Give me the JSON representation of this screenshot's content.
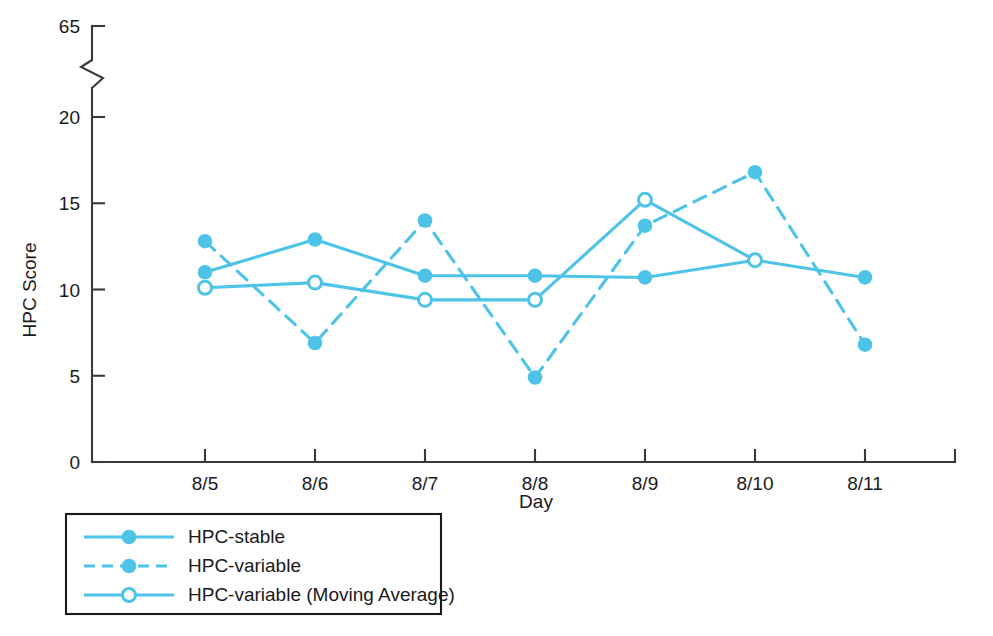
{
  "chart_data": {
    "type": "line",
    "title": "",
    "xlabel": "Day",
    "ylabel": "HPC Score",
    "categories": [
      "8/5",
      "8/6",
      "8/7",
      "8/8",
      "8/9",
      "8/10",
      "8/11"
    ],
    "ytick_labels": [
      "0",
      "5",
      "10",
      "15",
      "20",
      "65"
    ],
    "ytick_values": [
      0,
      5,
      10,
      15,
      20,
      65
    ],
    "ylim": [
      0,
      20
    ],
    "axis_break": {
      "present": true,
      "between": [
        20,
        65
      ],
      "note": "y-axis broken between 20 and 65"
    },
    "grid": false,
    "legend_position": "below-left",
    "accent_color": "#4EC3E8",
    "axis_color": "#3a3a3a",
    "series": [
      {
        "name": "HPC-stable",
        "style": "solid",
        "marker": "filled-circle",
        "color": "#4EC3E8",
        "values": [
          11.0,
          12.9,
          10.8,
          10.8,
          10.7,
          11.7,
          10.7
        ]
      },
      {
        "name": "HPC-variable",
        "style": "dashed",
        "marker": "filled-circle",
        "color": "#4EC3E8",
        "values": [
          12.8,
          6.9,
          14.0,
          4.9,
          13.7,
          16.8,
          6.8
        ]
      },
      {
        "name": "HPC-variable (Moving Average)",
        "style": "solid",
        "marker": "open-circle",
        "color": "#4EC3E8",
        "values": [
          10.1,
          10.4,
          9.4,
          9.4,
          15.2,
          11.7,
          null
        ]
      }
    ]
  }
}
